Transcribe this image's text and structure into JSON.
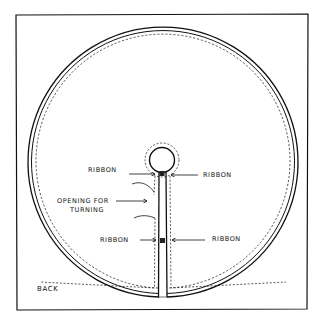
{
  "diagram": {
    "type": "sewing-pattern",
    "labels": {
      "ribbon_top_left": "RIBBON",
      "ribbon_top_right": "RIBBON",
      "opening_line1": "OPENING FOR",
      "opening_line2": "TURNING",
      "ribbon_bottom_left": "RIBBON",
      "ribbon_bottom_right": "RIBBON",
      "side": "BACK"
    },
    "colors": {
      "ink": "#111111",
      "paper": "#ffffff"
    }
  }
}
